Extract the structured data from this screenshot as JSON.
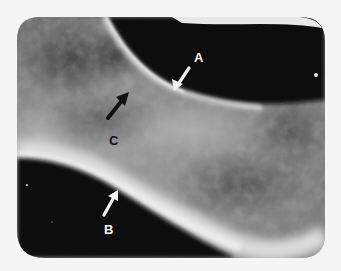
{
  "image": {
    "kind": "radiograph",
    "description": "Grayscale X-ray of a bone segment with three labeled arrows",
    "width": 341,
    "height": 271
  },
  "annotations": [
    {
      "id": "A",
      "label": "A",
      "arrow_color": "#f2f2f2",
      "label_color": "#f2f2f2",
      "points_to": "upper cortical margin"
    },
    {
      "id": "B",
      "label": "B",
      "arrow_color": "#f2f2f2",
      "label_color": "#f2f2f2",
      "points_to": "lower cortical margin"
    },
    {
      "id": "C",
      "label": "C",
      "arrow_color": "#111111",
      "label_color": "#111111",
      "points_to": "trabecular interior"
    }
  ],
  "colors": {
    "page_background": "#f5f5f5",
    "film_dark": "#0b0b0b",
    "bone_mid": "#8a8a8a",
    "bone_bright": "#e6e6e6"
  }
}
